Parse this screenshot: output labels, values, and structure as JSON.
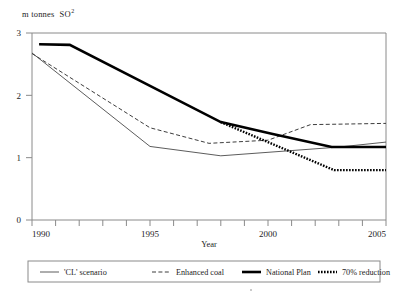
{
  "figure": {
    "unit_label_main": "m tonnes",
    "unit_label_species": "SO",
    "unit_label_superscript": "2"
  },
  "axes": {
    "x_title": "Year",
    "x_tick_labels": [
      "1990",
      "1995",
      "2000",
      "2005"
    ],
    "y_tick_labels": [
      "0",
      "1",
      "2",
      "3"
    ]
  },
  "legend": {
    "entries": [
      {
        "label": "'CL' scenario",
        "style": "thin-solid",
        "color": "#4a4a4a"
      },
      {
        "label": "Enhanced coal",
        "style": "dashed",
        "color": "#4a4a4a"
      },
      {
        "label": "National Plan",
        "style": "thick-solid",
        "color": "#000000"
      },
      {
        "label": "70% reduction",
        "style": "dotted-thick",
        "color": "#000000"
      }
    ]
  },
  "chart_data": {
    "type": "line",
    "title": "",
    "xlabel": "Year",
    "ylabel": "m tonnes SO2",
    "xlim": [
      1990,
      2005
    ],
    "ylim": [
      0,
      3
    ],
    "x_ticks": [
      1990,
      1991,
      1992,
      1993,
      1994,
      1995,
      1996,
      1997,
      1998,
      1999,
      2000,
      2001,
      2002,
      2003,
      2004,
      2005
    ],
    "x_tick_labels_shown": [
      1990,
      1995,
      2000,
      2005
    ],
    "y_ticks": [
      0,
      1,
      2,
      3
    ],
    "grid": false,
    "legend_position": "below-axes",
    "series": [
      {
        "name": "'CL' scenario",
        "x": [
          1990,
          1995,
          1998,
          2003,
          2005
        ],
        "values": [
          2.68,
          1.18,
          1.03,
          1.17,
          1.25
        ]
      },
      {
        "name": "Enhanced coal",
        "x": [
          1990,
          1995,
          1997.5,
          2000,
          2001.8,
          2005
        ],
        "values": [
          2.67,
          1.48,
          1.23,
          1.28,
          1.53,
          1.55
        ]
      },
      {
        "name": "National Plan",
        "x": [
          1990.3,
          1991.6,
          1998,
          2000.2,
          2002.7,
          2005
        ],
        "values": [
          2.82,
          2.81,
          1.57,
          1.38,
          1.17,
          1.17
        ]
      },
      {
        "name": "70% reduction",
        "x": [
          1998,
          2002.8,
          2005
        ],
        "values": [
          1.57,
          0.8,
          0.8
        ]
      }
    ]
  }
}
